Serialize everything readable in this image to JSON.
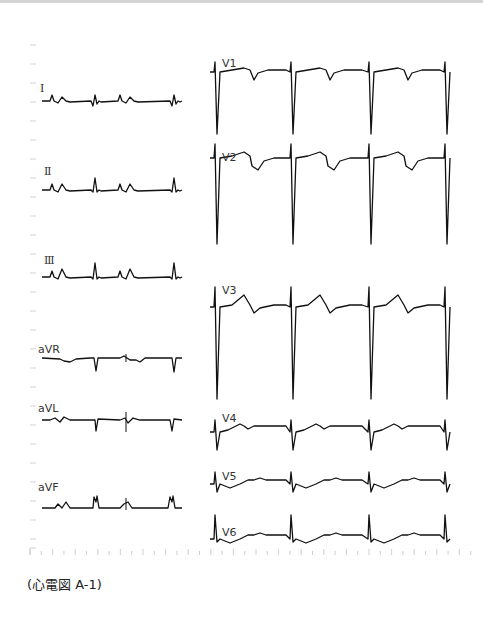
{
  "chart_data": {
    "type": "line",
    "title": "",
    "caption": "(心電図 A-1)",
    "layout": {
      "left_column": [
        "I",
        "II",
        "III",
        "aVR",
        "aVL",
        "aVF"
      ],
      "right_column": [
        "V1",
        "V2",
        "V3",
        "V4",
        "V5",
        "V6"
      ],
      "grid": false,
      "time_ticks": true
    },
    "beats_per_strip": {
      "limb": 4,
      "precordial": 4
    },
    "series": [
      {
        "name": "I",
        "morphology": "small upright QRS, flat ST, low T"
      },
      {
        "name": "II",
        "morphology": "upright QRS, upright T"
      },
      {
        "name": "III",
        "morphology": "upright QRS with notch, upright T"
      },
      {
        "name": "aVR",
        "morphology": "negative QRS, inverted T"
      },
      {
        "name": "aVL",
        "morphology": "small negative QRS"
      },
      {
        "name": "aVF",
        "morphology": "upright notched QRS, upright T"
      },
      {
        "name": "V1",
        "morphology": "deep S wave, inverted T"
      },
      {
        "name": "V2",
        "morphology": "deep S wave, ST elevation with inverted terminal T"
      },
      {
        "name": "V3",
        "morphology": "deep S wave, ST elevation with terminal T inversion"
      },
      {
        "name": "V4",
        "morphology": "RS complex, biphasic T"
      },
      {
        "name": "V5",
        "morphology": "small R, low T"
      },
      {
        "name": "V6",
        "morphology": "upright R, low T"
      }
    ]
  },
  "labels": {
    "I": "Ⅰ",
    "II": "Ⅱ",
    "III": "Ⅲ",
    "aVR": "aVR",
    "aVL": "aVL",
    "aVF": "aVF",
    "V1": "V1",
    "V2": "V2",
    "V3": "V3",
    "V4": "V4",
    "V5": "V5",
    "V6": "V6"
  },
  "caption": "(心電図 A-1)"
}
